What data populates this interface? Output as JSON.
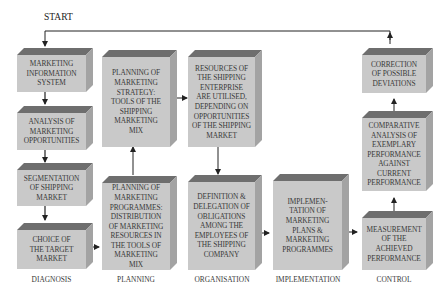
{
  "start_label": "START",
  "stages": [
    {
      "label": "DIAGNOSIS"
    },
    {
      "label": "PLANNING"
    },
    {
      "label": "ORGANISATION"
    },
    {
      "label": "IMPLEMENTATION"
    },
    {
      "label": "CONTROL"
    }
  ],
  "boxes": {
    "mis": "MARKETING\nINFORMATION\nSYSTEM",
    "analysis": "ANALYSIS OF\nMARKETING\nOPPORTUNITIES",
    "segmentation": "SEGMENTATION\nOF SHIPPING\nMARKET",
    "target": "CHOICE OF\nTHE TARGET\nMARKET",
    "strategy": "PLANNING OF\nMARKETING\nSTRATEGY:\nTOOLS OF THE\nSHIPPING\nMARKETING\nMIX",
    "programmes": "PLANNING OF\nMARKETING\nPROGRAMMES:\nDISTRIBUTION\nOF MARKETING\nRESOURCES IN\nTHE TOOLS OF\nMARKETING\nMIX",
    "resources": "RESOURCES OF\nTHE SHIPPING\nENTERPRISE\nARE UTILISED,\nDEPENDING ON\nOPPORTUNITIES\nOF THE SHIPPING\nMARKET",
    "delegation": "DEFINITION &\nDELEGATION OF\nOBLIGATIONS\nAMONG THE\nEMPLOYEES OF\nTHE SHIPPING\nCOMPANY",
    "implementation": "IMPLEMEN-\nTATION OF\nMARKETING\nPLANS &\nMARKETING\nPROGRAMMES",
    "correction": "CORRECTION\nOF POSSIBLE\nDEVIATIONS",
    "comparative": "COMPARATIVE\nANALYSIS OF\nEXEMPLARY\nPERFORMANCE\nAGAINST\nCURRENT\nPERFORMANCE",
    "measurement": "MEASUREMENT\nOF THE\nACHIEVED\nPERFORMANCE"
  },
  "colors": {
    "box_front": "#c9c9c9",
    "box_top": "#6e6e6e",
    "box_side": "#a3a3a3",
    "text": "#3a3a3a",
    "line": "#222222"
  }
}
